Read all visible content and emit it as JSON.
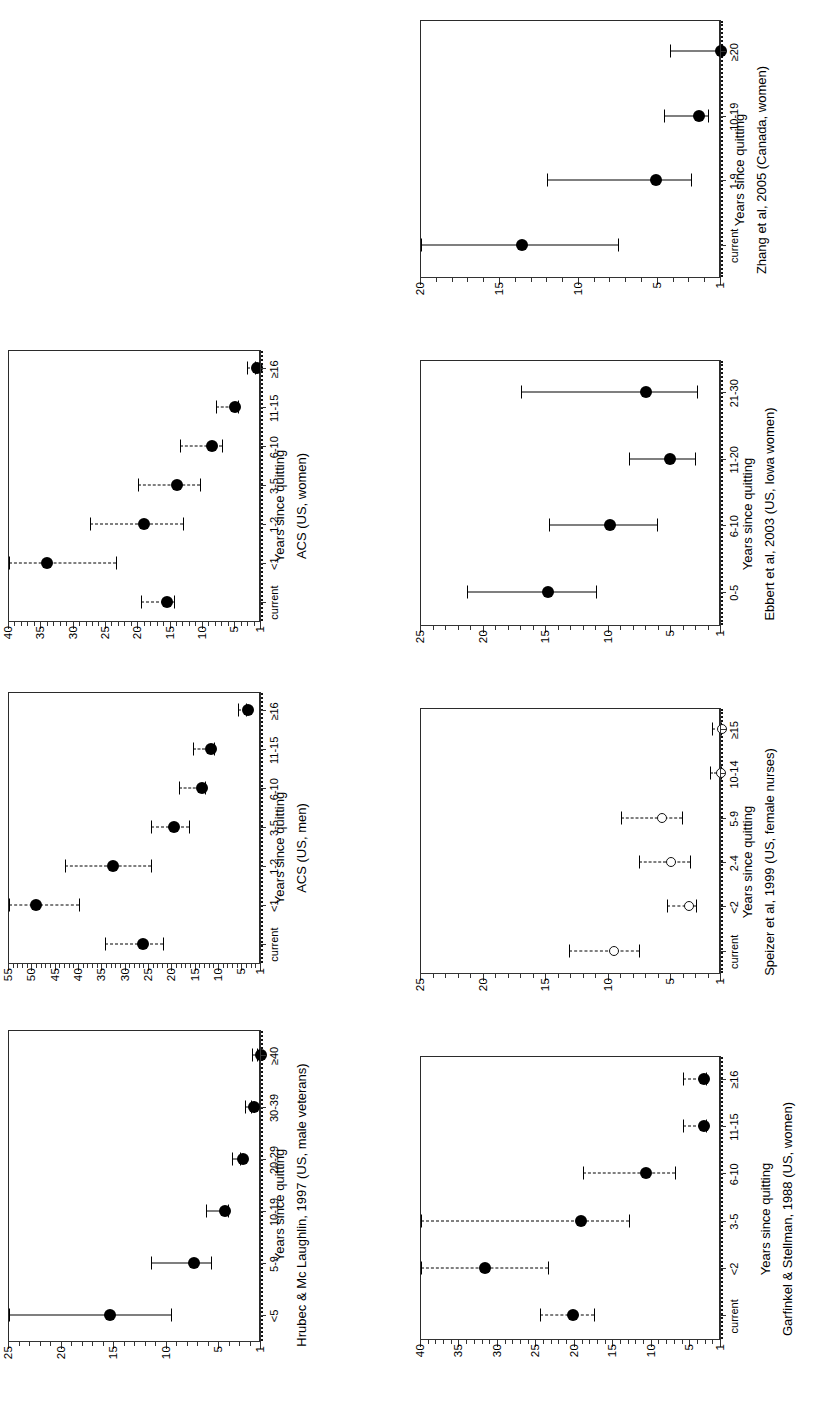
{
  "figure": {
    "axis_title": "Years since quitting",
    "marker_filled": "filled-circle",
    "marker_open": "open-circle",
    "reference_value": 1
  },
  "chart_data": [
    {
      "id": "hrubec-1997",
      "type": "scatter",
      "title": "Hrubec & Mc Laughlin, 1997 (US, male veterans)",
      "xlabel": "Years since quitting",
      "ylabel": "",
      "ylim": [
        1,
        25
      ],
      "yticks": [
        1,
        5,
        10,
        15,
        20,
        25
      ],
      "ytick_labels": [
        "1",
        "5",
        "10",
        "15",
        "20",
        "25"
      ],
      "grid": false,
      "legend": "none",
      "marker": "filled-circle",
      "errorbar_style": "solid",
      "categories": [
        "<5",
        "5-9",
        "10-19",
        "20-29",
        "30-39",
        "≥40"
      ],
      "values": [
        16.0,
        8.0,
        5.0,
        3.3,
        2.2,
        1.6
      ],
      "ci_low": [
        9.6,
        5.8,
        4.1,
        3.0,
        2.0,
        1.4
      ],
      "ci_high": [
        25.0,
        11.5,
        6.2,
        3.8,
        2.5,
        1.9
      ]
    },
    {
      "id": "acs-us-men",
      "type": "scatter",
      "title": "ACS (US, men)",
      "xlabel": "Years since quitting",
      "ylabel": "",
      "ylim": [
        1,
        55
      ],
      "yticks": [
        1,
        5,
        10,
        15,
        20,
        25,
        30,
        35,
        40,
        45,
        50,
        55
      ],
      "ytick_labels": [
        "1",
        "5",
        "10",
        "15",
        "20",
        "25",
        "30",
        "35",
        "40",
        "45",
        "50",
        "55"
      ],
      "grid": false,
      "legend": "none",
      "marker": "filled-circle",
      "errorbar_style": "dashed",
      "categories": [
        "current",
        "<1",
        "1-2",
        "3-5",
        "6-10",
        "11-15",
        "≥16"
      ],
      "values": [
        27.5,
        50.5,
        34.0,
        21.0,
        15.0,
        13.0,
        5.0
      ],
      "ci_low": [
        22.0,
        40.0,
        24.5,
        16.5,
        13.0,
        11.0,
        4.2
      ],
      "ci_high": [
        34.5,
        55.0,
        43.0,
        24.5,
        18.5,
        15.5,
        6.0
      ]
    },
    {
      "id": "acs-us-women",
      "type": "scatter",
      "title": "ACS (US, women)",
      "xlabel": "Years since quitting",
      "ylabel": "",
      "ylim": [
        1,
        40
      ],
      "yticks": [
        1,
        5,
        10,
        15,
        20,
        25,
        30,
        35,
        40
      ],
      "ytick_labels": [
        "1",
        "5",
        "10",
        "15",
        "20",
        "25",
        "30",
        "35",
        "40"
      ],
      "grid": false,
      "legend": "none",
      "marker": "filled-circle",
      "errorbar_style": "dashed",
      "categories": [
        "current",
        "<1",
        "1-2",
        "3-5",
        "6-10",
        "11-15",
        "≥16"
      ],
      "values": [
        16.5,
        35.0,
        20.0,
        15.0,
        9.5,
        6.0,
        2.5
      ],
      "ci_low": [
        14.5,
        23.5,
        13.0,
        10.5,
        7.0,
        4.5,
        1.9
      ],
      "ci_high": [
        19.5,
        40.0,
        27.5,
        20.0,
        13.5,
        8.0,
        3.2
      ]
    },
    {
      "id": "zhang-2005",
      "type": "scatter",
      "title": "Zhang et al, 2005 (Canada, women)",
      "xlabel": "Years since quitting",
      "ylabel": "",
      "ylim": [
        1,
        20
      ],
      "yticks": [
        1,
        5,
        10,
        15,
        20
      ],
      "ytick_labels": [
        "1",
        "5",
        "10",
        "15",
        "20"
      ],
      "grid": false,
      "legend": "none",
      "marker": "filled-circle",
      "errorbar_style": "solid",
      "categories": [
        "current",
        "1-9",
        "10-19",
        "≥20"
      ],
      "values": [
        14.0,
        5.5,
        2.8,
        1.4
      ],
      "ci_low": [
        7.5,
        2.9,
        1.8,
        1.0
      ],
      "ci_high": [
        20.0,
        12.0,
        4.6,
        4.2
      ]
    },
    {
      "id": "ebbert-2003",
      "type": "scatter",
      "title": "Ebbert et al, 2003 (US, Iowa women)",
      "xlabel": "Years since quitting",
      "ylabel": "",
      "ylim": [
        1,
        25
      ],
      "yticks": [
        1,
        5,
        10,
        15,
        20,
        25
      ],
      "ytick_labels": [
        "1",
        "5",
        "10",
        "15",
        "20",
        "25"
      ],
      "grid": false,
      "legend": "none",
      "marker": "filled-circle",
      "errorbar_style": "solid",
      "categories": [
        "0-5",
        "6-10",
        "11-20",
        "21-30"
      ],
      "values": [
        15.3,
        10.4,
        5.6,
        7.5
      ],
      "ci_low": [
        11.0,
        6.1,
        3.1,
        2.9
      ],
      "ci_high": [
        21.3,
        14.8,
        8.4,
        17.0
      ]
    },
    {
      "id": "speizer-1999",
      "type": "scatter",
      "title": "Speizer  et al, 1999 (US, female nurses)",
      "xlabel": "Years since quitting",
      "ylabel": "",
      "ylim": [
        1,
        25
      ],
      "yticks": [
        1,
        5,
        10,
        15,
        20,
        25
      ],
      "ytick_labels": [
        "1",
        "5",
        "10",
        "15",
        "20",
        "25"
      ],
      "grid": false,
      "legend": "none",
      "marker": "open-circle",
      "errorbar_style": "dashed",
      "categories": [
        "current",
        "<2",
        "2-4",
        "5-9",
        "10-14",
        "≥15"
      ],
      "values": [
        10.0,
        4.0,
        5.4,
        6.1,
        1.4,
        1.3
      ],
      "ci_low": [
        7.6,
        3.0,
        3.5,
        4.1,
        1.0,
        1.0
      ],
      "ci_high": [
        13.2,
        5.3,
        7.6,
        9.0,
        1.9,
        1.7
      ]
    },
    {
      "id": "garfinkel-stellman-1988",
      "type": "scatter",
      "title": "Garfinkel & Stellman, 1988 (US, women)",
      "xlabel": "Years since quitting",
      "ylabel": "",
      "ylim": [
        1,
        40
      ],
      "yticks": [
        1,
        5,
        10,
        15,
        20,
        25,
        30,
        35,
        40
      ],
      "ytick_labels": [
        "1",
        "5",
        "10",
        "15",
        "20",
        "25",
        "30",
        "35",
        "40"
      ],
      "grid": false,
      "legend": "none",
      "marker": "filled-circle",
      "errorbar_style": "dashed",
      "categories": [
        "current",
        "<2",
        "3-5",
        "6-10",
        "11-15",
        "≥16"
      ],
      "values": [
        21.0,
        32.5,
        20.0,
        11.5,
        4.0,
        4.0
      ],
      "ci_low": [
        17.5,
        23.5,
        13.0,
        7.0,
        2.9,
        3.0
      ],
      "ci_high": [
        24.5,
        40.0,
        40.0,
        19.0,
        6.0,
        6.0
      ]
    }
  ],
  "panels": [
    {
      "name": "panel-hrubec-1997",
      "slot": {
        "left": 0,
        "top": 1008,
        "w": 330,
        "h": 394
      },
      "size": {
        "w": 394,
        "h": 330
      },
      "plot": {
        "l": 60,
        "t": 8,
        "w": 312,
        "h": 252
      },
      "axis_title_top": 272,
      "caption_top": 294,
      "xlabel_font": 11,
      "data_index": 0
    },
    {
      "name": "panel-acs-us-men",
      "slot": {
        "left": 0,
        "top": 672,
        "w": 330,
        "h": 352
      },
      "size": {
        "w": 352,
        "h": 330
      },
      "plot": {
        "l": 60,
        "t": 8,
        "w": 272,
        "h": 252
      },
      "axis_title_top": 272,
      "caption_top": 294,
      "xlabel_font": 11,
      "data_index": 1
    },
    {
      "name": "panel-acs-us-women",
      "slot": {
        "left": 0,
        "top": 330,
        "w": 330,
        "h": 352
      },
      "size": {
        "w": 352,
        "h": 330
      },
      "plot": {
        "l": 60,
        "t": 8,
        "w": 272,
        "h": 252
      },
      "axis_title_top": 272,
      "caption_top": 294,
      "xlabel_font": 11,
      "data_index": 2
    },
    {
      "name": "panel-zhang-2005",
      "slot": {
        "left": 410,
        "top": 0,
        "w": 407,
        "h": 340
      },
      "size": {
        "w": 340,
        "h": 407
      },
      "plot": {
        "l": 62,
        "t": 10,
        "w": 258,
        "h": 300
      },
      "axis_title_top": 322,
      "caption_top": 344,
      "xlabel_font": 11,
      "data_index": 3
    },
    {
      "name": "panel-ebbert-2003",
      "slot": {
        "left": 410,
        "top": 340,
        "w": 407,
        "h": 348
      },
      "size": {
        "w": 348,
        "h": 407
      },
      "plot": {
        "l": 62,
        "t": 10,
        "w": 266,
        "h": 300
      },
      "axis_title_top": 330,
      "caption_top": 352,
      "xlabel_font": 11,
      "data_index": 4
    },
    {
      "name": "panel-speizer-1999",
      "slot": {
        "left": 410,
        "top": 688,
        "w": 407,
        "h": 348
      },
      "size": {
        "w": 348,
        "h": 407
      },
      "plot": {
        "l": 62,
        "t": 10,
        "w": 266,
        "h": 300
      },
      "axis_title_top": 330,
      "caption_top": 352,
      "xlabel_font": 11,
      "data_index": 5
    },
    {
      "name": "panel-garfinkel-1988",
      "slot": {
        "left": 410,
        "top": 1036,
        "w": 407,
        "h": 366
      },
      "size": {
        "w": 366,
        "h": 407
      },
      "plot": {
        "l": 62,
        "t": 10,
        "w": 284,
        "h": 300
      },
      "axis_title_top": 348,
      "caption_top": 370,
      "xlabel_font": 11,
      "data_index": 6
    }
  ]
}
